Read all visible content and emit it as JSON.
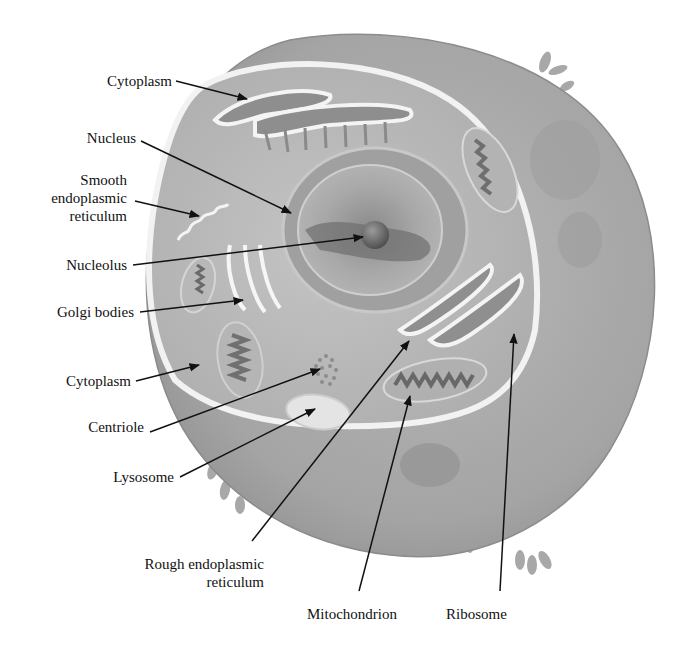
{
  "diagram": {
    "colors": {
      "background": "#ffffff",
      "cell_body": "#a9a9a9",
      "cytoplasm": "#bdbdbd",
      "membrane_highlight": "#f4f4f4",
      "nucleus": "#9a9a9a",
      "label_text": "#111111",
      "leader_line": "#111111"
    },
    "labels": {
      "cytoplasm_top": "Cytoplasm",
      "nucleus": "Nucleus",
      "smooth_er_line1": "Smooth",
      "smooth_er_line2": "endoplasmic",
      "smooth_er_line3": "reticulum",
      "nucleolus": "Nucleolus",
      "golgi": "Golgi bodies",
      "cytoplasm_mid": "Cytoplasm",
      "centriole": "Centriole",
      "lysosome": "Lysosome",
      "rough_er_line1": "Rough endoplasmic",
      "rough_er_line2": "reticulum",
      "mitochondrion": "Mitochondrion",
      "ribosome": "Ribosome"
    }
  }
}
